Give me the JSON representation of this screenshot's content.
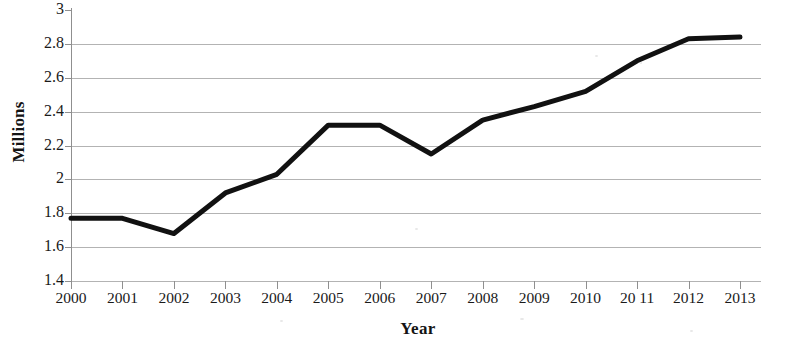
{
  "chart_data": {
    "type": "line",
    "title": "",
    "xlabel": "Year",
    "ylabel": "Millions",
    "categories": [
      "2000",
      "2001",
      "2002",
      "2003",
      "2004",
      "2005",
      "2006",
      "2007",
      "2008",
      "2009",
      "2010",
      "20 11",
      "2012",
      "2013"
    ],
    "x": [
      2000,
      2001,
      2002,
      2003,
      2004,
      2005,
      2006,
      2007,
      2008,
      2009,
      2010,
      2011,
      2012,
      2013
    ],
    "values": [
      1.77,
      1.77,
      1.68,
      1.92,
      2.03,
      2.32,
      2.32,
      2.15,
      2.35,
      2.43,
      2.52,
      2.7,
      2.83,
      2.84
    ],
    "series": [
      {
        "name": "Millions",
        "values": [
          1.77,
          1.77,
          1.68,
          1.92,
          2.03,
          2.32,
          2.32,
          2.15,
          2.35,
          2.43,
          2.52,
          2.7,
          2.83,
          2.84
        ]
      }
    ],
    "ylim": [
      1.4,
      3.0
    ],
    "ytick_labels": [
      "3",
      "2.8",
      "2.6",
      "2.4",
      "2.2",
      "2",
      "1.8",
      "1.6",
      "1.4"
    ],
    "ytick_values": [
      3.0,
      2.8,
      2.6,
      2.4,
      2.2,
      2.0,
      1.8,
      1.6,
      1.4
    ],
    "grid": true,
    "grid_axis": "y",
    "legend": false,
    "legend_position": "none",
    "line_color": "#111111",
    "line_width": 5,
    "markers": false,
    "background_color": "#ffffff",
    "gridline_color": "#9a9a9a",
    "axis_color": "#8f8f8f"
  }
}
